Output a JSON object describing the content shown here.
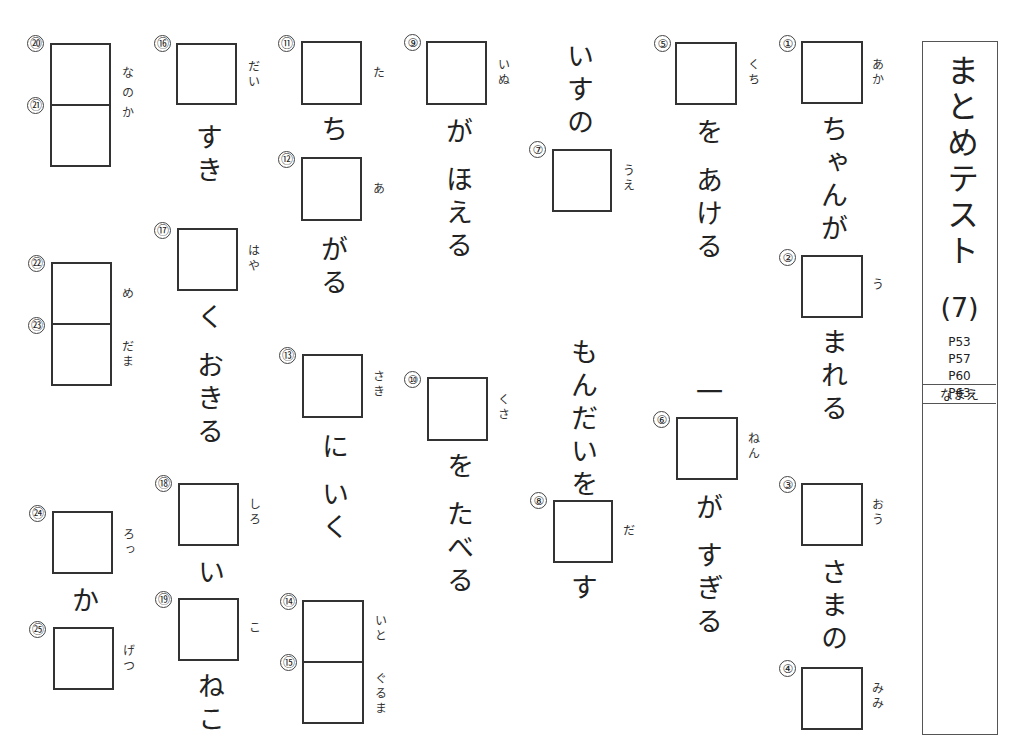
{
  "title": {
    "text": "まとめテスト",
    "number": "(7)",
    "pages": [
      "P53",
      "P57",
      "P60",
      "P63"
    ],
    "name_label": "なまえ"
  },
  "questions": [
    {
      "n": "①",
      "reading": "あか"
    },
    {
      "n": "②",
      "reading": "う"
    },
    {
      "n": "③",
      "reading": "おう"
    },
    {
      "n": "④",
      "reading": "みみ"
    },
    {
      "n": "⑤",
      "reading": "くち"
    },
    {
      "n": "⑥",
      "reading": "ねん"
    },
    {
      "n": "⑦",
      "reading": "うえ"
    },
    {
      "n": "⑧",
      "reading": "だ"
    },
    {
      "n": "⑨",
      "reading": "いぬ"
    },
    {
      "n": "⑩",
      "reading": "くさ"
    },
    {
      "n": "⑪",
      "reading": "た"
    },
    {
      "n": "⑫",
      "reading": "あ"
    },
    {
      "n": "⑬",
      "reading": "さき"
    },
    {
      "n": "⑭",
      "reading": "いと"
    },
    {
      "n": "⑮",
      "reading": "ぐるま"
    },
    {
      "n": "⑯",
      "reading": "だい"
    },
    {
      "n": "⑰",
      "reading": "はや"
    },
    {
      "n": "⑱",
      "reading": "しろ"
    },
    {
      "n": "⑲",
      "reading": "こ"
    },
    {
      "n": "⑳",
      "reading": "なのか"
    },
    {
      "n": "㉑",
      "reading": ""
    },
    {
      "n": "㉒",
      "reading": "め"
    },
    {
      "n": "㉓",
      "reading": "だま"
    },
    {
      "n": "㉔",
      "reading": "ろっ"
    },
    {
      "n": "㉕",
      "reading": "げつ"
    }
  ],
  "texts": {
    "t1": "ちゃんが",
    "t2": "まれる",
    "t3": "さまの",
    "t5": "を あける",
    "t6pre": "一",
    "t6": "が すぎる",
    "t7pre": "いすの",
    "t8pre": "もんだいを",
    "t8": "す",
    "t9": "が ほえる",
    "t10": "を たべる",
    "t11": "ち",
    "t12": "がる",
    "t13": "に いく",
    "t16": "すき",
    "t17": "く おきる",
    "t18": "い",
    "t19": "ねこ",
    "t24": "か"
  }
}
